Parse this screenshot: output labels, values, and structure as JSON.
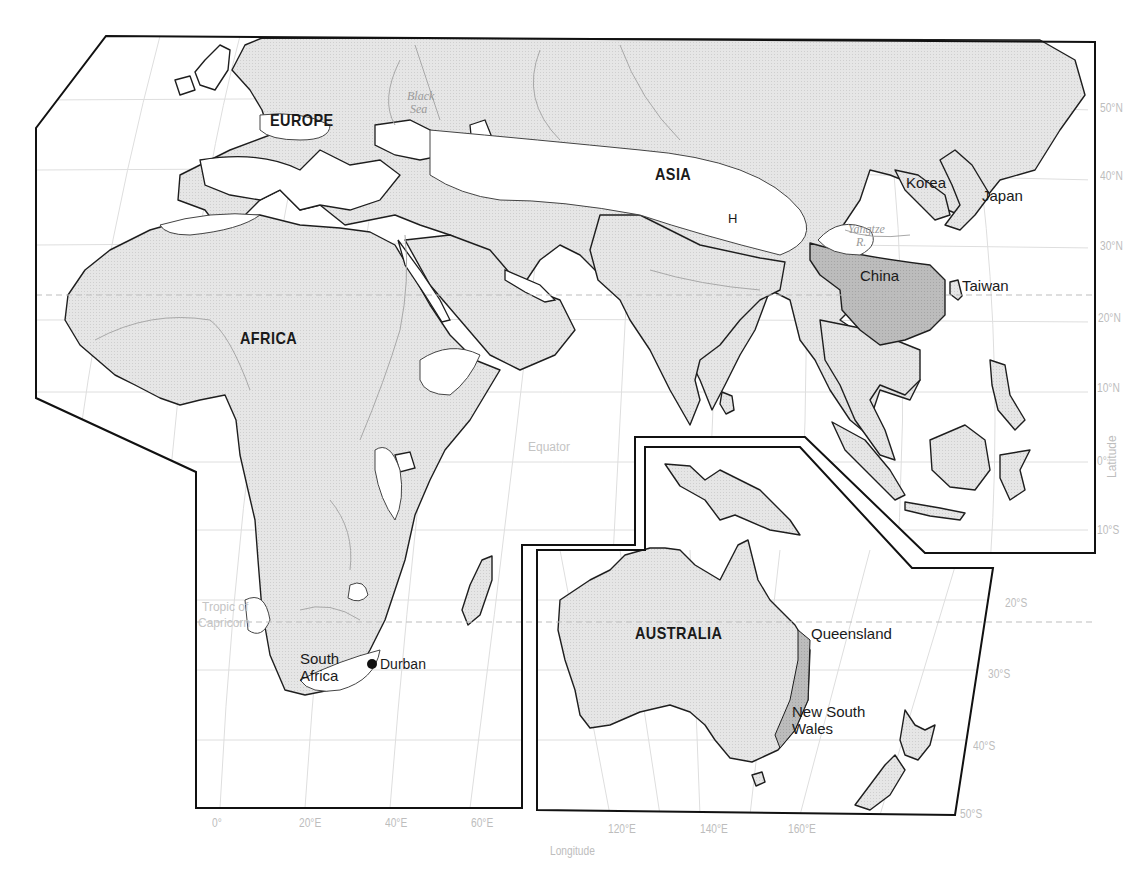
{
  "map": {
    "title": "",
    "colors": {
      "land": "#e4e4e4",
      "highlight": "#b9b9b9",
      "water": "#ffffff",
      "coast": "#1e1e1e",
      "grid": "#dcdcdc",
      "river": "#a8a8a8",
      "frame": "#111111",
      "axis_text": "#bdbdbd"
    },
    "regions": {
      "europe": "EUROPE",
      "asia": "ASIA",
      "africa": "AFRICA",
      "australia": "AUSTRALIA"
    },
    "places": {
      "korea": "Korea",
      "japan": "Japan",
      "china": "China",
      "taiwan": "Taiwan",
      "south_africa_line1": "South",
      "south_africa_line2": "Africa",
      "durban": "Durban",
      "queensland": "Queensland",
      "nsw_line1": "New South",
      "nsw_line2": "Wales",
      "h_marker": "H"
    },
    "water_labels": {
      "black_sea_line1": "Black",
      "black_sea_line2": "Sea",
      "yangtze_line1": "Yangtze",
      "yangtze_line2": "R."
    },
    "reference_lines": {
      "equator": "Equator",
      "tropic_line1": "Tropic of",
      "tropic_line2": "Capricorn"
    },
    "latitude_axis": {
      "title": "Latitude",
      "ticks": [
        "50°N",
        "40°N",
        "30°N",
        "20°N",
        "10°N",
        "0°",
        "10°S",
        "20°S",
        "30°S",
        "40°S",
        "50°S"
      ]
    },
    "longitude_axis": {
      "title": "Longitude",
      "ticks": [
        "0°",
        "20°E",
        "40°E",
        "60°E",
        "120°E",
        "140°E",
        "160°E"
      ]
    },
    "markers": [
      {
        "name": "Durban",
        "type": "city-dot"
      }
    ]
  }
}
